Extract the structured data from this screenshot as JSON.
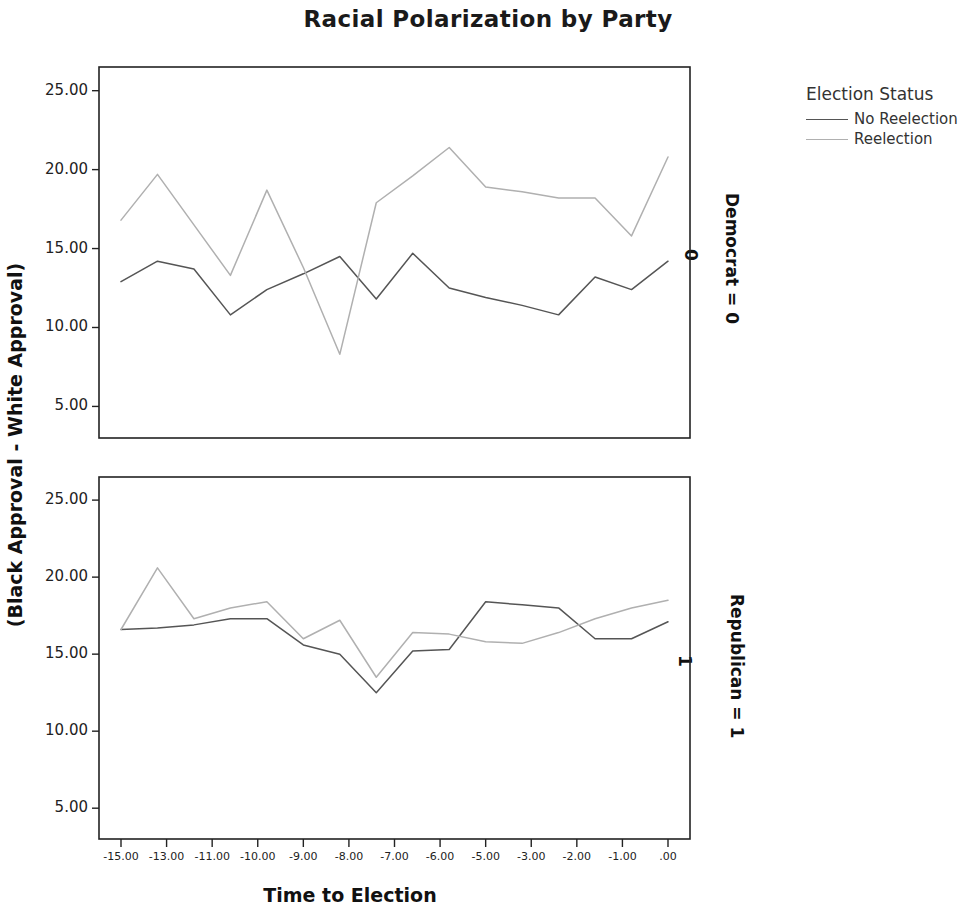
{
  "header": {
    "title": "Racial Polarization by Party"
  },
  "legend": {
    "title": "Election Status",
    "position": "right-top",
    "entries": [
      {
        "label": "No Reelection",
        "color": "#555555"
      },
      {
        "label": "Reelection",
        "color": "#b0b0b0"
      }
    ]
  },
  "axes": {
    "xlabel": "Time to Election",
    "ylabel": "(Black Approval - White Approval)",
    "yticks": [
      "5.00",
      "10.00",
      "15.00",
      "20.00",
      "25.00"
    ],
    "xticks": [
      "-15.00",
      "-13.00",
      "-11.00",
      "-10.00",
      "-9.00",
      "-8.00",
      "-7.00",
      "-6.00",
      "-5.00",
      "-3.00",
      "-2.00",
      "-1.00",
      ".00"
    ],
    "ylim": [
      3.0,
      26.5
    ],
    "grid": "off"
  },
  "panels": [
    {
      "strip_label": "Democrat = 0",
      "strip_value": "0"
    },
    {
      "strip_label": "Republican = 1",
      "strip_value": "1"
    }
  ],
  "chart_data": {
    "type": "line",
    "title": "Racial Polarization by Party",
    "xlabel": "Time to Election",
    "ylabel": "(Black Approval - White Approval)",
    "ylim": [
      3.0,
      26.5
    ],
    "grid": false,
    "legend_title": "Election Status",
    "legend_position": "right-top",
    "x": [
      -15,
      -14,
      -13,
      -12,
      -11,
      -10,
      -9,
      -8,
      -7,
      -6,
      -5,
      -4,
      -3,
      -2,
      -1,
      0
    ],
    "x_tick_labels": [
      "-15.00",
      "-13.00",
      "-11.00",
      "-10.00",
      "-9.00",
      "-8.00",
      "-7.00",
      "-6.00",
      "-5.00",
      "-3.00",
      "-2.00",
      "-1.00",
      ".00"
    ],
    "panels": [
      {
        "name": "Democrat = 0",
        "strip_value": "0",
        "series": [
          {
            "name": "No Reelection",
            "color": "#555555",
            "values": [
              12.9,
              14.2,
              13.7,
              10.8,
              12.4,
              13.4,
              14.5,
              11.8,
              14.7,
              12.5,
              11.9,
              11.4,
              10.8,
              13.2,
              12.4,
              14.2
            ]
          },
          {
            "name": "Reelection",
            "color": "#b0b0b0",
            "values": [
              16.8,
              19.7,
              16.5,
              13.3,
              18.7,
              13.8,
              8.3,
              17.9,
              19.6,
              21.4,
              18.9,
              18.6,
              18.2,
              18.2,
              15.8,
              20.8
            ]
          }
        ]
      },
      {
        "name": "Republican = 1",
        "strip_value": "1",
        "series": [
          {
            "name": "No Reelection",
            "color": "#555555",
            "values": [
              16.6,
              16.7,
              16.9,
              17.3,
              17.3,
              15.6,
              15.0,
              12.5,
              15.2,
              15.3,
              18.4,
              18.2,
              18.0,
              16.0,
              16.0,
              17.1
            ]
          },
          {
            "name": "Reelection",
            "color": "#b0b0b0",
            "values": [
              16.6,
              20.6,
              17.3,
              18.0,
              18.4,
              16.0,
              17.2,
              13.5,
              16.4,
              16.3,
              15.8,
              15.7,
              16.4,
              17.3,
              18.0,
              18.5
            ]
          }
        ]
      }
    ]
  }
}
